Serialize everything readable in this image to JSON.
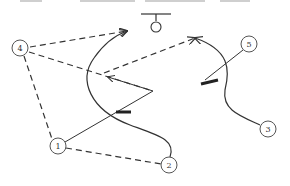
{
  "diagram": {
    "type": "play-diagram",
    "colors": {
      "line": "#333333",
      "background": "#ffffff",
      "node_stroke": "#555555"
    },
    "nodes": [
      {
        "id": "1",
        "label": "1",
        "x": 58,
        "y": 146
      },
      {
        "id": "2",
        "label": "2",
        "x": 169,
        "y": 165
      },
      {
        "id": "3",
        "label": "3",
        "x": 268,
        "y": 129
      },
      {
        "id": "4",
        "label": "4",
        "x": 20,
        "y": 48
      },
      {
        "id": "5",
        "label": "5",
        "x": 249,
        "y": 44
      }
    ],
    "hoop": {
      "x": 155,
      "y": 14
    },
    "screens": [
      {
        "x": 122,
        "y": 113
      },
      {
        "x": 210,
        "y": 82
      }
    ],
    "edges": [
      {
        "from": "4",
        "to": "target-a",
        "style": "dashed",
        "arrow": true
      },
      {
        "from": "4",
        "to": "screen-1",
        "style": "dashed",
        "arrow": true
      },
      {
        "from": "4",
        "to": "1",
        "style": "dashed",
        "arrow": false
      },
      {
        "from": "1",
        "to": "2",
        "style": "dashed",
        "arrow": false
      },
      {
        "from": "1",
        "to": "screen-1",
        "style": "solid",
        "arrow": false
      },
      {
        "from": "2",
        "to": "target-a",
        "style": "solid-curve",
        "arrow": true
      },
      {
        "from": "3",
        "to": "target-b",
        "style": "solid-curve",
        "arrow": true
      },
      {
        "from": "5",
        "to": "screen-2",
        "style": "solid",
        "arrow": false
      },
      {
        "from": "screen-1-corner",
        "to": "target-b",
        "style": "dashed",
        "arrow": true
      }
    ]
  }
}
